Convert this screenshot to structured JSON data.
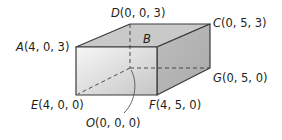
{
  "figure": {
    "type": "rectangular-prism",
    "face_label": "B",
    "points": {
      "A": {
        "label": "A",
        "coords": "(4, 0, 3)"
      },
      "C": {
        "label": "C",
        "coords": "(0, 5, 3)"
      },
      "D": {
        "label": "D",
        "coords": "(0, 0, 3)"
      },
      "E": {
        "label": "E",
        "coords": "(4, 0, 0)"
      },
      "F": {
        "label": "F",
        "coords": "(4, 5, 0)"
      },
      "G": {
        "label": "G",
        "coords": "(0, 5, 0)"
      },
      "O": {
        "label": "O",
        "coords": "(0, 0, 0)"
      }
    },
    "colors": {
      "top_face": "#c8c8c8",
      "right_face": "#b5b5b5",
      "front_face_light": "#f4f4f4",
      "front_face_dark": "#c9c9c9",
      "edge": "#3a3a3a",
      "label": "#231f20"
    }
  }
}
